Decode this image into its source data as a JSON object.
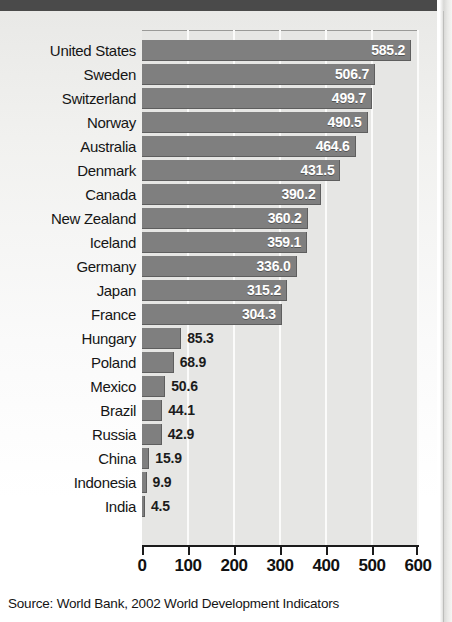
{
  "figure": {
    "source_note": "Source:  World Bank, 2002 World Development Indicators"
  },
  "chart_data": {
    "type": "bar",
    "orientation": "horizontal",
    "title": "",
    "subtitle": "",
    "xlabel": "",
    "ylabel": "",
    "xlim": [
      0,
      600
    ],
    "xticks": [
      "0",
      "100",
      "200",
      "300",
      "400",
      "500",
      "600"
    ],
    "xtick_values": [
      0,
      100,
      200,
      300,
      400,
      500,
      600
    ],
    "grid": "vertical-white-gridlines",
    "legend": "none",
    "bar_color": "#7f7f7f",
    "plot_background": "#e6e6e4",
    "inside_label_color": "#ffffff",
    "outside_label_color": "#1b1b1b",
    "categories": [
      "United States",
      "Sweden",
      "Switzerland",
      "Norway",
      "Australia",
      "Denmark",
      "Canada",
      "New Zealand",
      "Iceland",
      "Germany",
      "Japan",
      "France",
      "Hungary",
      "Poland",
      "Mexico",
      "Brazil",
      "Russia",
      "China",
      "Indonesia",
      "India"
    ],
    "values": [
      585.2,
      506.7,
      499.7,
      490.5,
      464.6,
      431.5,
      390.2,
      360.2,
      359.1,
      336.0,
      315.2,
      304.3,
      85.3,
      68.9,
      50.6,
      44.1,
      42.9,
      15.9,
      9.9,
      4.5
    ],
    "value_labels": [
      "585.2",
      "506.7",
      "499.7",
      "490.5",
      "464.6",
      "431.5",
      "390.2",
      "360.2",
      "359.1",
      "336.0",
      "315.2",
      "304.3",
      "85.3",
      "68.9",
      "50.6",
      "44.1",
      "42.9",
      "15.9",
      "9.9",
      "4.5"
    ],
    "label_placement": [
      "inside",
      "inside",
      "inside",
      "inside",
      "inside",
      "inside",
      "inside",
      "inside",
      "inside",
      "inside",
      "inside",
      "inside",
      "outside",
      "outside",
      "outside",
      "outside",
      "outside",
      "outside",
      "outside",
      "outside"
    ]
  }
}
